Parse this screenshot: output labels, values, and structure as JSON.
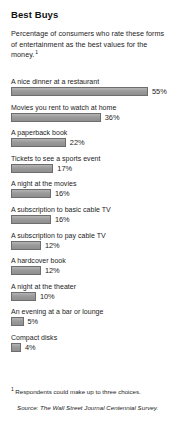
{
  "chart_data": {
    "type": "bar",
    "orientation": "horizontal",
    "title": "Best Buys",
    "subtitle": "Percentage of consumers who rate these forms of entertainment as the best values for the money.",
    "subtitle_footnote_ref": "1",
    "categories": [
      "A nice dinner at a restaurant",
      "Movies you rent to watch at home",
      "A paperback book",
      "Tickets to see a sports event",
      "A night at the movies",
      "A subscription to basic cable TV",
      "A subscription to pay cable TV",
      "A hardcover book",
      "A night at the theater",
      "An evening at a bar or lounge",
      "Compact disks"
    ],
    "values": [
      55,
      36,
      22,
      17,
      16,
      16,
      12,
      12,
      10,
      5,
      4
    ],
    "value_labels": [
      "55%",
      "36%",
      "22%",
      "17%",
      "16%",
      "16%",
      "12%",
      "12%",
      "10%",
      "5%",
      "4%"
    ],
    "unit": "%",
    "xlabel": "",
    "ylabel": "",
    "xlim": [
      0,
      55
    ],
    "grid": false,
    "legend": false,
    "bar_color": "#9b9b9b",
    "bar_border_color": "#6d6d6d",
    "footnote_marker": "1",
    "footnote": "Respondents could make up to three choices.",
    "source": "Source: The Wall Street Journal Centennial Survey."
  }
}
